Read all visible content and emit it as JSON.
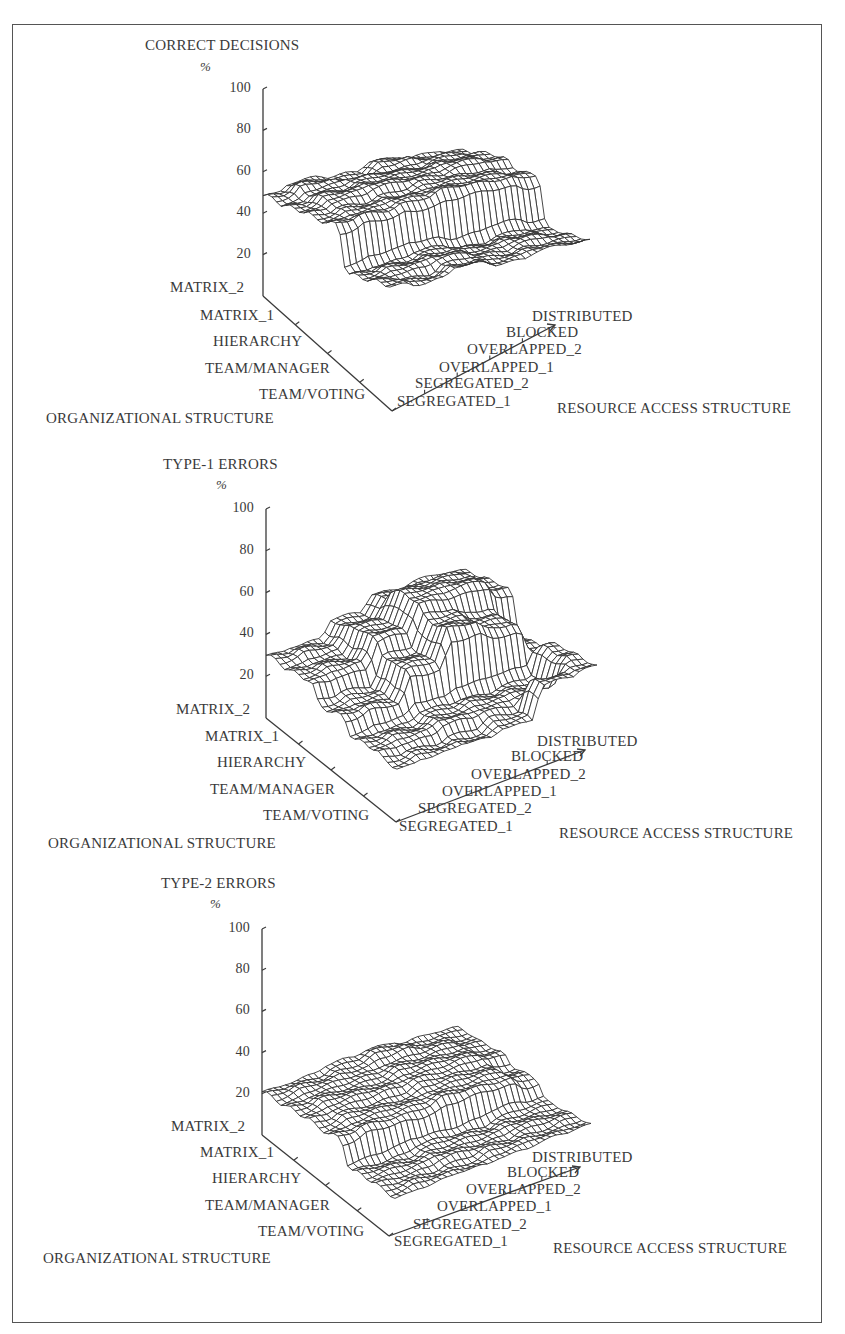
{
  "figure": {
    "org_axis_label": "ORGANIZATIONAL STRUCTURE",
    "resource_axis_label": "RESOURCE ACCESS STRUCTURE",
    "unit_label": "%",
    "y_ticks": [
      "100",
      "80",
      "60",
      "40",
      "20"
    ],
    "org_levels": [
      "MATRIX_2",
      "MATRIX_1",
      "HIERARCHY",
      "TEAM/MANAGER",
      "TEAM/VOTING"
    ],
    "resource_levels": [
      "SEGREGATED_1",
      "SEGREGATED_2",
      "OVERLAPPED_1",
      "OVERLAPPED_2",
      "BLOCKED",
      "DISTRIBUTED"
    ]
  },
  "charts": [
    {
      "title": "CORRECT DECISIONS"
    },
    {
      "title": "TYPE-1 ERRORS"
    },
    {
      "title": "TYPE-2 ERRORS"
    }
  ],
  "chart_data": [
    {
      "type": "surface3d",
      "title": "CORRECT DECISIONS",
      "zlabel": "%",
      "xlabel": "ORGANIZATIONAL STRUCTURE",
      "ylabel": "RESOURCE ACCESS STRUCTURE",
      "zlim": [
        0,
        100
      ],
      "zticks": [
        20,
        40,
        60,
        80,
        100
      ],
      "rows": [
        "MATRIX_2",
        "MATRIX_1",
        "HIERARCHY",
        "TEAM/MANAGER",
        "TEAM/VOTING"
      ],
      "cols": [
        "SEGREGATED_1",
        "SEGREGATED_2",
        "OVERLAPPED_1",
        "OVERLAPPED_2",
        "BLOCKED",
        "DISTRIBUTED"
      ],
      "values": [
        [
          48,
          52,
          50,
          54,
          52,
          50
        ],
        [
          46,
          50,
          52,
          52,
          54,
          52
        ],
        [
          44,
          46,
          48,
          50,
          50,
          48
        ],
        [
          22,
          24,
          26,
          24,
          26,
          24
        ],
        [
          22,
          20,
          24,
          22,
          24,
          24
        ]
      ]
    },
    {
      "type": "surface3d",
      "title": "TYPE-1 ERRORS",
      "zlabel": "%",
      "xlabel": "ORGANIZATIONAL STRUCTURE",
      "ylabel": "RESOURCE ACCESS STRUCTURE",
      "zlim": [
        0,
        100
      ],
      "zticks": [
        20,
        40,
        60,
        80,
        100
      ],
      "rows": [
        "MATRIX_2",
        "MATRIX_1",
        "HIERARCHY",
        "TEAM/MANAGER",
        "TEAM/VOTING"
      ],
      "cols": [
        "SEGREGATED_1",
        "SEGREGATED_2",
        "OVERLAPPED_1",
        "OVERLAPPED_2",
        "BLOCKED",
        "DISTRIBUTED"
      ],
      "values": [
        [
          30,
          32,
          40,
          48,
          50,
          49
        ],
        [
          28,
          30,
          42,
          55,
          56,
          50
        ],
        [
          18,
          20,
          34,
          48,
          44,
          30
        ],
        [
          10,
          12,
          16,
          18,
          20,
          34
        ],
        [
          6,
          8,
          10,
          14,
          30,
          33
        ]
      ]
    },
    {
      "type": "surface3d",
      "title": "TYPE-2 ERRORS",
      "zlabel": "%",
      "xlabel": "ORGANIZATIONAL STRUCTURE",
      "ylabel": "RESOURCE ACCESS STRUCTURE",
      "zlim": [
        0,
        100
      ],
      "zticks": [
        20,
        40,
        60,
        80,
        100
      ],
      "rows": [
        "MATRIX_2",
        "MATRIX_1",
        "HIERARCHY",
        "TEAM/MANAGER",
        "TEAM/VOTING"
      ],
      "cols": [
        "SEGREGATED_1",
        "SEGREGATED_2",
        "OVERLAPPED_1",
        "OVERLAPPED_2",
        "BLOCKED",
        "DISTRIBUTED"
      ],
      "values": [
        [
          21,
          22,
          24,
          26,
          24,
          23
        ],
        [
          20,
          22,
          22,
          24,
          24,
          22
        ],
        [
          18,
          20,
          20,
          22,
          22,
          18
        ],
        [
          6,
          6,
          8,
          8,
          10,
          10
        ],
        [
          4,
          5,
          6,
          8,
          9,
          10
        ]
      ]
    }
  ]
}
